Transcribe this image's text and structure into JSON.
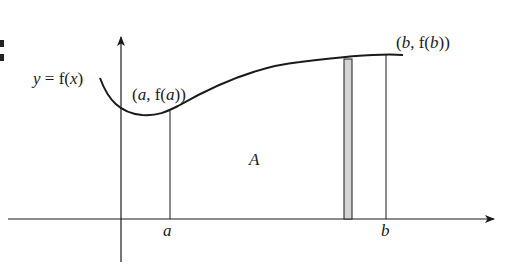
{
  "diagram": {
    "type": "area-under-curve",
    "function_label": "y = f(x)",
    "point_a_label": "(a, f(a))",
    "point_b_label": "(b, f(b))",
    "area_label": "A",
    "x_tick_a": "a",
    "x_tick_b": "b",
    "colors": {
      "stroke": "#1a1a1a",
      "strip_fill": "#d4d4d4",
      "background": "#ffffff"
    }
  }
}
